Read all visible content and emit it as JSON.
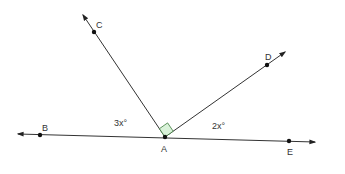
{
  "diagram": {
    "type": "geometry-angles",
    "points": {
      "A": {
        "label": "A",
        "x": 165,
        "y": 137
      },
      "B": {
        "label": "B",
        "x": 40,
        "y": 135
      },
      "C": {
        "label": "C",
        "x": 94,
        "y": 32
      },
      "D": {
        "label": "D",
        "x": 267,
        "y": 65
      },
      "E": {
        "label": "E",
        "x": 289,
        "y": 141
      }
    },
    "lines": [
      {
        "name": "line-BE",
        "from": [
          18,
          134
        ],
        "to": [
          315,
          142
        ],
        "arrows": "both"
      },
      {
        "name": "ray-AC",
        "from": [
          165,
          137
        ],
        "to": [
          83,
          15
        ],
        "arrows": "end"
      },
      {
        "name": "ray-AD",
        "from": [
          165,
          137
        ],
        "to": [
          285,
          52
        ],
        "arrows": "end"
      }
    ],
    "angle_labels": {
      "left": "3x°",
      "right": "2x°"
    },
    "right_angle_marker": {
      "at": "A",
      "between": [
        "C",
        "D"
      ],
      "fill": "#d9f2d9",
      "stroke": "#3a7a3a"
    },
    "colors": {
      "line": "#333333",
      "point": "#111111",
      "text": "#333333"
    }
  }
}
